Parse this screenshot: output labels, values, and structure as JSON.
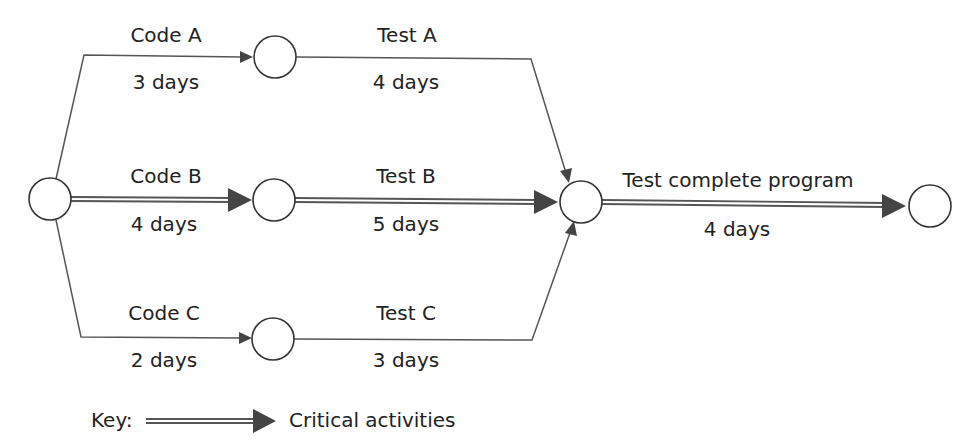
{
  "diagram": {
    "type": "activity-network",
    "colors": {
      "line": "#555555",
      "arrowhead": "#444444",
      "node_stroke": "#333333",
      "text": "#222222",
      "background": "#ffffff"
    },
    "activities": {
      "code_a": {
        "name": "Code A",
        "duration": "3 days",
        "critical": false
      },
      "code_b": {
        "name": "Code B",
        "duration": "4 days",
        "critical": true
      },
      "code_c": {
        "name": "Code C",
        "duration": "2 days",
        "critical": false
      },
      "test_a": {
        "name": "Test A",
        "duration": "4 days",
        "critical": false
      },
      "test_b": {
        "name": "Test B",
        "duration": "5 days",
        "critical": true
      },
      "test_c": {
        "name": "Test C",
        "duration": "3 days",
        "critical": false
      },
      "test_complete": {
        "name": "Test complete program",
        "duration": "4 days",
        "critical": true
      }
    },
    "nodes": [
      "start",
      "after-code-a",
      "after-code-b",
      "after-code-c",
      "merge",
      "end"
    ],
    "key": {
      "label": "Key:",
      "description": "Critical activities"
    }
  }
}
